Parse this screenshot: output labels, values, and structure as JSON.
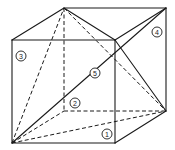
{
  "figure": {
    "type": "cube-dissection",
    "stroke_color": "#1a1a1a",
    "background": "#ffffff"
  },
  "vertices": {
    "A": [
      12,
      143
    ],
    "B": [
      115,
      143
    ],
    "C": [
      115,
      40
    ],
    "D": [
      12,
      40
    ],
    "E": [
      64,
      8
    ],
    "F": [
      166,
      8
    ],
    "G": [
      166,
      111
    ],
    "H": [
      64,
      111
    ]
  },
  "solid_edges": [
    [
      "A",
      "B"
    ],
    [
      "B",
      "C"
    ],
    [
      "C",
      "D"
    ],
    [
      "D",
      "A"
    ],
    [
      "D",
      "E"
    ],
    [
      "E",
      "F"
    ],
    [
      "F",
      "C"
    ],
    [
      "F",
      "G"
    ],
    [
      "G",
      "B"
    ],
    [
      "E",
      "C"
    ],
    [
      "C",
      "G"
    ],
    [
      "A",
      "F"
    ]
  ],
  "dashed_edges": [
    [
      "E",
      "H"
    ],
    [
      "H",
      "G"
    ],
    [
      "A",
      "H"
    ],
    [
      "A",
      "E"
    ],
    [
      "E",
      "G"
    ],
    [
      "A",
      "G"
    ]
  ],
  "labels": [
    {
      "id": "1",
      "text": "1",
      "x": 107,
      "y": 134
    },
    {
      "id": "2",
      "text": "2",
      "x": 75,
      "y": 103
    },
    {
      "id": "3",
      "text": "3",
      "x": 21,
      "y": 56
    },
    {
      "id": "4",
      "text": "4",
      "x": 157,
      "y": 32
    },
    {
      "id": "5",
      "text": "5",
      "x": 95,
      "y": 73
    }
  ]
}
